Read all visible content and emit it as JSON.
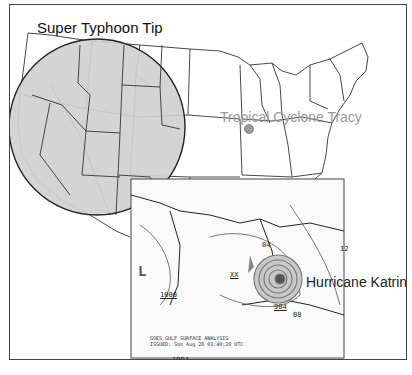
{
  "map": {
    "base": "Continental United States state outline map",
    "labels": {
      "super_typhoon_tip": "Super Typhoon Tip",
      "tropical_cyclone_tracy": "Tropical Cyclone Tracy",
      "hurricane_katrina": "Hurricane Katrina"
    },
    "inset": {
      "caption_line1": "GOES GULF SURFACE ANALYSIS",
      "caption_line2": "ISSUED: Sun Aug 28 03:40:28 UTC",
      "low_symbol": "L",
      "pressure_labels": {
        "p1000": "1000",
        "p1004": "1004",
        "p1008": "1008",
        "p1012": "12",
        "p904": "904",
        "p908": "908",
        "p04": "04",
        "p08": "08",
        "lon_80w": "80W",
        "lon_90w": "90W",
        "lat_20n": "20N",
        "xx": "XX"
      }
    },
    "colors": {
      "circle_fill": "#d0d0d0",
      "tracy_dot": "#9a9a9a",
      "outline": "#333333",
      "katrina_rings": "#7a7a7a"
    }
  }
}
